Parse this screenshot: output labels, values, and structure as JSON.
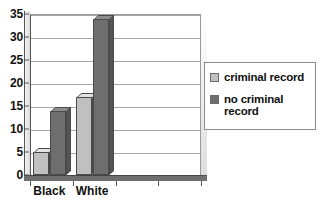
{
  "chart_data": {
    "type": "bar",
    "title": "",
    "subtitle": "",
    "xlabel": "",
    "ylabel": "",
    "categories": [
      "Black",
      "White"
    ],
    "series": [
      {
        "name": "criminal record",
        "color": "#c0c0c0",
        "values": [
          5,
          17
        ]
      },
      {
        "name": "no criminal record",
        "color": "#6e6e6e",
        "values": [
          14,
          34
        ]
      }
    ],
    "ylim": [
      0,
      35
    ],
    "ytick_step": 5,
    "yticks": [
      0,
      5,
      10,
      15,
      20,
      25,
      30,
      35
    ],
    "ytick_labels": [
      "0",
      "5",
      "10",
      "15",
      "20",
      "25",
      "30",
      "35"
    ],
    "grid": true,
    "grid_axis": "y",
    "legend_position": "right",
    "style": "3d-column",
    "empty_category_slots": 2
  },
  "legend": {
    "entries": [
      {
        "label": "criminal record"
      },
      {
        "label": "no criminal record"
      }
    ]
  }
}
